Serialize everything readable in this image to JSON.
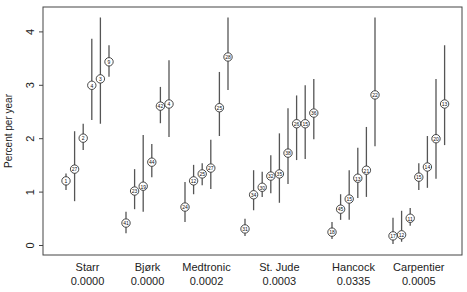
{
  "chart_data": {
    "type": "scatter",
    "subtype": "point-estimate-with-confidence-intervals",
    "title": "",
    "xlabel": "",
    "ylabel": "Percent per year",
    "ylim": [
      0,
      4.3
    ],
    "yticks": [
      0,
      1,
      2,
      3,
      4
    ],
    "grid": false,
    "legend": null,
    "groups": [
      {
        "name": "Starr",
        "p_value": "0.0000",
        "points": [
          {
            "label": "1",
            "value": 1.21,
            "lo": 1.04,
            "hi": 1.35
          },
          {
            "label": "27",
            "value": 1.43,
            "lo": 0.83,
            "hi": 2.14
          },
          {
            "label": "2",
            "value": 2.01,
            "lo": 1.79,
            "hi": 2.28
          },
          {
            "label": "4",
            "value": 3.0,
            "lo": 2.35,
            "hi": 3.87
          },
          {
            "label": "3",
            "value": 3.12,
            "lo": 2.28,
            "hi": 4.27
          },
          {
            "label": "9",
            "value": 3.44,
            "lo": 3.16,
            "hi": 3.75
          }
        ]
      },
      {
        "name": "Bjørk",
        "p_value": "0.0000",
        "points": [
          {
            "label": "41",
            "value": 0.42,
            "lo": 0.23,
            "hi": 0.63
          },
          {
            "label": "23",
            "value": 1.02,
            "lo": 0.68,
            "hi": 1.43
          },
          {
            "label": "19",
            "value": 1.11,
            "lo": 0.63,
            "hi": 2.07
          },
          {
            "label": "44",
            "value": 1.56,
            "lo": 1.28,
            "hi": 1.9
          },
          {
            "label": "42",
            "value": 2.61,
            "lo": 2.29,
            "hi": 2.97
          },
          {
            "label": "4",
            "value": 2.65,
            "lo": 2.03,
            "hi": 3.47
          }
        ]
      },
      {
        "name": "Medtronic",
        "p_value": "0.0002",
        "points": [
          {
            "label": "24",
            "value": 0.72,
            "lo": 0.44,
            "hi": 1.19
          },
          {
            "label": "12",
            "value": 1.21,
            "lo": 0.96,
            "hi": 1.51
          },
          {
            "label": "25",
            "value": 1.34,
            "lo": 1.13,
            "hi": 1.54
          },
          {
            "label": "27",
            "value": 1.45,
            "lo": 1.06,
            "hi": 1.98
          },
          {
            "label": "25",
            "value": 2.58,
            "lo": 2.05,
            "hi": 3.25
          },
          {
            "label": "28",
            "value": 3.53,
            "lo": 2.91,
            "hi": 4.27
          }
        ]
      },
      {
        "name": "St. Jude",
        "p_value": "0.0003",
        "points": [
          {
            "label": "31",
            "value": 0.31,
            "lo": 0.18,
            "hi": 0.5
          },
          {
            "label": "34",
            "value": 0.95,
            "lo": 0.66,
            "hi": 1.41
          },
          {
            "label": "30",
            "value": 1.09,
            "lo": 0.91,
            "hi": 1.38
          },
          {
            "label": "32",
            "value": 1.3,
            "lo": 0.98,
            "hi": 1.69
          },
          {
            "label": "35",
            "value": 1.34,
            "lo": 0.8,
            "hi": 2.1
          },
          {
            "label": "38",
            "value": 1.73,
            "lo": 1.15,
            "hi": 2.57
          },
          {
            "label": "26",
            "value": 2.28,
            "lo": 1.6,
            "hi": 2.81
          },
          {
            "label": "15",
            "value": 2.28,
            "lo": 1.62,
            "hi": 3.0
          },
          {
            "label": "36",
            "value": 2.48,
            "lo": 1.99,
            "hi": 3.12
          }
        ]
      },
      {
        "name": "Hancock",
        "p_value": "0.0335",
        "points": [
          {
            "label": "18",
            "value": 0.25,
            "lo": 0.12,
            "hi": 0.44
          },
          {
            "label": "45",
            "value": 0.68,
            "lo": 0.48,
            "hi": 0.96
          },
          {
            "label": "15",
            "value": 0.87,
            "lo": 0.48,
            "hi": 1.41
          },
          {
            "label": "13",
            "value": 1.26,
            "lo": 0.89,
            "hi": 1.83
          },
          {
            "label": "21",
            "value": 1.41,
            "lo": 0.91,
            "hi": 2.22
          },
          {
            "label": "22",
            "value": 2.82,
            "lo": 1.86,
            "hi": 4.27
          }
        ]
      },
      {
        "name": "Carpentier",
        "p_value": "0.0005",
        "points": [
          {
            "label": "17",
            "value": 0.18,
            "lo": 0.03,
            "hi": 0.52
          },
          {
            "label": "12",
            "value": 0.2,
            "lo": 0.07,
            "hi": 0.65
          },
          {
            "label": "11",
            "value": 0.51,
            "lo": 0.37,
            "hi": 0.7
          },
          {
            "label": "15",
            "value": 1.28,
            "lo": 1.04,
            "hi": 1.54
          },
          {
            "label": "14",
            "value": 1.47,
            "lo": 1.08,
            "hi": 2.05
          },
          {
            "label": "20",
            "value": 2.0,
            "lo": 1.25,
            "hi": 3.12
          },
          {
            "label": "13",
            "value": 2.65,
            "lo": 1.88,
            "hi": 3.75
          }
        ]
      }
    ]
  },
  "layout": {
    "plot": {
      "left": 43,
      "right": 462,
      "top": 7,
      "bottom": 255
    },
    "y_zero_px": 245.5,
    "px_per_unit": 53.4,
    "group_x_starts": [
      66,
      126,
      185,
      245,
      332,
      393
    ],
    "point_spacing": 8.6
  }
}
